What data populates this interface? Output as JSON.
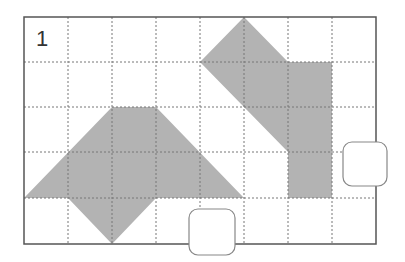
{
  "figure": {
    "label": "1",
    "grid": {
      "cols": 8,
      "rows": 5,
      "x0": 24,
      "y0": 17,
      "cell_w": 44,
      "cell_h": 45.4
    },
    "colors": {
      "shape_fill": "#b3b3b3",
      "border": "#555555",
      "gridline": "#777777",
      "box_stroke": "#888888"
    },
    "shapes": [
      {
        "name": "left-shape",
        "points_grid": [
          [
            2,
            2
          ],
          [
            3,
            2
          ],
          [
            5,
            4
          ],
          [
            3,
            4
          ],
          [
            2,
            5
          ],
          [
            1,
            4
          ],
          [
            0,
            4
          ]
        ]
      },
      {
        "name": "right-shape",
        "points_grid": [
          [
            4,
            1
          ],
          [
            5,
            0
          ],
          [
            6,
            1
          ],
          [
            7,
            1
          ],
          [
            7,
            4
          ],
          [
            6,
            4
          ],
          [
            6,
            3
          ]
        ]
      }
    ],
    "answer_boxes": [
      {
        "name": "answer-box-bottom",
        "x": 189,
        "y": 209,
        "w": 46,
        "h": 46,
        "value": ""
      },
      {
        "name": "answer-box-right",
        "x": 343,
        "y": 142,
        "w": 44,
        "h": 44,
        "value": ""
      }
    ]
  }
}
